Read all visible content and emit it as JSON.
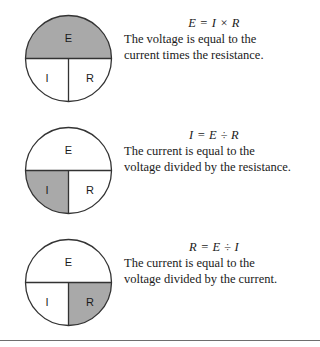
{
  "page": {
    "background_color": "#ffffff",
    "rule_color": "#6e6e6e",
    "shade_color": "#a9a9a9",
    "stroke_color": "#333333"
  },
  "rows": [
    {
      "id": "ohms-law-voltage",
      "diagram": {
        "name": "ohms-law-wheel-E-highlighted",
        "labels": {
          "top": "E",
          "bottom_left": "I",
          "bottom_right": "R"
        },
        "highlighted": "top",
        "highlight_color": "#a9a9a9"
      },
      "formula": "E = I × R",
      "sentence_lines": [
        "The voltage is equal to the",
        "current times the resistance."
      ]
    },
    {
      "id": "ohms-law-current",
      "diagram": {
        "name": "ohms-law-wheel-I-highlighted",
        "labels": {
          "top": "E",
          "bottom_left": "I",
          "bottom_right": "R"
        },
        "highlighted": "bottom_left",
        "highlight_color": "#a9a9a9"
      },
      "formula": "I = E ÷ R",
      "sentence_lines": [
        "The current is equal to the",
        "voltage divided by the resistance."
      ]
    },
    {
      "id": "ohms-law-resistance",
      "diagram": {
        "name": "ohms-law-wheel-R-highlighted",
        "labels": {
          "top": "E",
          "bottom_left": "I",
          "bottom_right": "R"
        },
        "highlighted": "bottom_right",
        "highlight_color": "#a9a9a9"
      },
      "formula": "R = E ÷ I",
      "sentence_lines": [
        "The current is equal to the",
        "voltage divided by the current."
      ]
    }
  ]
}
